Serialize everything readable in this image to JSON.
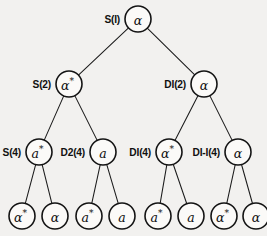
{
  "figure": {
    "kind": "binary-derivation-tree",
    "title": "",
    "background_color": "#f2f1ef",
    "ink_color": "#141414",
    "node_fill": "#fbfaf8",
    "levels": 4
  },
  "nodes": [
    {
      "id": "n-root",
      "tag": "S(I)",
      "symbol": "α",
      "star": "",
      "symbol_full": "α",
      "level": 1,
      "cx": 138,
      "cy": 19,
      "r": 13,
      "tag_x": 120,
      "name": "node-s1"
    },
    {
      "id": "n-s2",
      "tag": "S(2)",
      "symbol": "α",
      "star": "*",
      "symbol_full": "α*",
      "level": 2,
      "cx": 69,
      "cy": 84,
      "r": 13,
      "tag_x": 51,
      "name": "node-s2"
    },
    {
      "id": "n-di2",
      "tag": "DI(2)",
      "symbol": "α",
      "star": "",
      "symbol_full": "α",
      "level": 2,
      "cx": 204,
      "cy": 84,
      "r": 13,
      "tag_x": 186,
      "name": "node-di2"
    },
    {
      "id": "n-s4",
      "tag": "S(4)",
      "symbol": "a",
      "star": "*",
      "symbol_full": "a*",
      "level": 3,
      "cx": 39,
      "cy": 152,
      "r": 13,
      "tag_x": 21,
      "name": "node-s4"
    },
    {
      "id": "n-d24",
      "tag": "D2(4)",
      "symbol": "a",
      "star": "",
      "symbol_full": "a",
      "level": 3,
      "cx": 103,
      "cy": 152,
      "r": 13,
      "tag_x": 85,
      "name": "node-d24"
    },
    {
      "id": "n-di4",
      "tag": "DI(4)",
      "symbol": "α",
      "star": "*",
      "symbol_full": "α*",
      "level": 3,
      "cx": 169,
      "cy": 152,
      "r": 13,
      "tag_x": 151,
      "name": "node-di4"
    },
    {
      "id": "n-dii4",
      "tag": "DI-I(4)",
      "symbol": "α",
      "star": "",
      "symbol_full": "α",
      "level": 3,
      "cx": 238,
      "cy": 152,
      "r": 13,
      "tag_x": 220,
      "name": "node-dii4"
    },
    {
      "id": "n-l1",
      "tag": "",
      "symbol": "α",
      "star": "*",
      "symbol_full": "α*",
      "level": 4,
      "cx": 22,
      "cy": 216,
      "r": 13,
      "tag_x": 0,
      "name": "leaf-alpha-star-1"
    },
    {
      "id": "n-l2",
      "tag": "",
      "symbol": "α",
      "star": "",
      "symbol_full": "α",
      "level": 4,
      "cx": 55,
      "cy": 216,
      "r": 13,
      "tag_x": 0,
      "name": "leaf-alpha-1"
    },
    {
      "id": "n-l3",
      "tag": "",
      "symbol": "a",
      "star": "*",
      "symbol_full": "a*",
      "level": 4,
      "cx": 89,
      "cy": 216,
      "r": 13,
      "tag_x": 0,
      "name": "leaf-a-star-1"
    },
    {
      "id": "n-l4",
      "tag": "",
      "symbol": "a",
      "star": "",
      "symbol_full": "a",
      "level": 4,
      "cx": 122,
      "cy": 216,
      "r": 13,
      "tag_x": 0,
      "name": "leaf-a-1"
    },
    {
      "id": "n-l5",
      "tag": "",
      "symbol": "a",
      "star": "*",
      "symbol_full": "a*",
      "level": 4,
      "cx": 158,
      "cy": 216,
      "r": 13,
      "tag_x": 0,
      "name": "leaf-a-star-2"
    },
    {
      "id": "n-l6",
      "tag": "",
      "symbol": "a",
      "star": "",
      "symbol_full": "a",
      "level": 4,
      "cx": 191,
      "cy": 216,
      "r": 13,
      "tag_x": 0,
      "name": "leaf-a-2"
    },
    {
      "id": "n-l7",
      "tag": "",
      "symbol": "α",
      "star": "*",
      "symbol_full": "α*",
      "level": 4,
      "cx": 224,
      "cy": 216,
      "r": 13,
      "tag_x": 0,
      "name": "leaf-alpha-star-2"
    },
    {
      "id": "n-l8",
      "tag": "",
      "symbol": "α",
      "star": "",
      "symbol_full": "α",
      "level": 4,
      "cx": 256,
      "cy": 216,
      "r": 13,
      "tag_x": 0,
      "name": "leaf-alpha-2"
    }
  ],
  "edges": [
    {
      "from": "n-root",
      "to": "n-s2",
      "name": "edge-s1-s2"
    },
    {
      "from": "n-root",
      "to": "n-di2",
      "name": "edge-s1-di2"
    },
    {
      "from": "n-s2",
      "to": "n-s4",
      "name": "edge-s2-s4"
    },
    {
      "from": "n-s2",
      "to": "n-d24",
      "name": "edge-s2-d24"
    },
    {
      "from": "n-di2",
      "to": "n-di4",
      "name": "edge-di2-di4"
    },
    {
      "from": "n-di2",
      "to": "n-dii4",
      "name": "edge-di2-dii4"
    },
    {
      "from": "n-s4",
      "to": "n-l1",
      "name": "edge-s4-leaf1"
    },
    {
      "from": "n-s4",
      "to": "n-l2",
      "name": "edge-s4-leaf2"
    },
    {
      "from": "n-d24",
      "to": "n-l3",
      "name": "edge-d24-leaf3"
    },
    {
      "from": "n-d24",
      "to": "n-l4",
      "name": "edge-d24-leaf4"
    },
    {
      "from": "n-di4",
      "to": "n-l5",
      "name": "edge-di4-leaf5"
    },
    {
      "from": "n-di4",
      "to": "n-l6",
      "name": "edge-di4-leaf6"
    },
    {
      "from": "n-dii4",
      "to": "n-l7",
      "name": "edge-dii4-leaf7"
    },
    {
      "from": "n-dii4",
      "to": "n-l8",
      "name": "edge-dii4-leaf8"
    }
  ]
}
